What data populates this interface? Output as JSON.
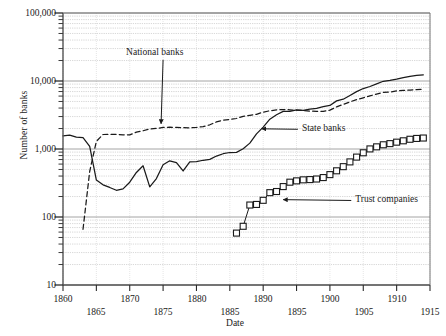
{
  "chart_data": {
    "type": "line",
    "title": "",
    "xlabel": "Date",
    "ylabel": "Number of banks",
    "xlim": [
      1860,
      1915
    ],
    "ylim": [
      10,
      100000
    ],
    "yscale": "log",
    "grid": true,
    "legend_position": "inline-annotations",
    "xticks": [
      1860,
      1865,
      1870,
      1875,
      1880,
      1885,
      1890,
      1895,
      1900,
      1905,
      1910,
      1915
    ],
    "xtick_labels": [
      "1860",
      "1865",
      "1870",
      "1875",
      "1880",
      "1885",
      "1890",
      "1895",
      "1900",
      "1905",
      "1910",
      "1915"
    ],
    "yticks": [
      10,
      100,
      1000,
      10000,
      100000
    ],
    "ytick_labels": [
      "10",
      "100",
      "1,000",
      "10,000",
      "100,000"
    ],
    "annotations": [
      {
        "name": "national-banks",
        "text": "National banks",
        "x": 1875.0,
        "y": 26000,
        "arrow_to_x": 1874.7,
        "arrow_to_y": 2350
      },
      {
        "name": "state-banks",
        "text": "State banks",
        "x": 1895.2,
        "y": 1950,
        "arrow_to_x": 1889.8,
        "arrow_to_y": 1980
      },
      {
        "name": "trust-companies",
        "text": "Trust companies",
        "x": 1903.2,
        "y": 175,
        "arrow_to_x": 1893.0,
        "arrow_to_y": 180
      }
    ],
    "series": [
      {
        "name": "National banks",
        "style": "dashed",
        "marker": "none",
        "color": "#1a1a1a",
        "points": [
          [
            1863,
            66
          ],
          [
            1864,
            467
          ],
          [
            1865,
            1294
          ],
          [
            1866,
            1634
          ],
          [
            1867,
            1636
          ],
          [
            1868,
            1640
          ],
          [
            1869,
            1617
          ],
          [
            1870,
            1612
          ],
          [
            1871,
            1767
          ],
          [
            1872,
            1853
          ],
          [
            1873,
            1968
          ],
          [
            1874,
            2004
          ],
          [
            1875,
            2076
          ],
          [
            1876,
            2091
          ],
          [
            1877,
            2078
          ],
          [
            1878,
            2056
          ],
          [
            1879,
            2048
          ],
          [
            1880,
            2076
          ],
          [
            1881,
            2132
          ],
          [
            1882,
            2269
          ],
          [
            1883,
            2501
          ],
          [
            1884,
            2664
          ],
          [
            1885,
            2714
          ],
          [
            1886,
            2809
          ],
          [
            1887,
            3014
          ],
          [
            1888,
            3120
          ],
          [
            1889,
            3239
          ],
          [
            1890,
            3484
          ],
          [
            1891,
            3652
          ],
          [
            1892,
            3759
          ],
          [
            1893,
            3807
          ],
          [
            1894,
            3770
          ],
          [
            1895,
            3715
          ],
          [
            1896,
            3689
          ],
          [
            1897,
            3610
          ],
          [
            1898,
            3581
          ],
          [
            1899,
            3583
          ],
          [
            1900,
            3731
          ],
          [
            1901,
            4163
          ],
          [
            1902,
            4532
          ],
          [
            1903,
            4935
          ],
          [
            1904,
            5327
          ],
          [
            1905,
            5664
          ],
          [
            1906,
            6046
          ],
          [
            1907,
            6412
          ],
          [
            1908,
            6817
          ],
          [
            1909,
            6886
          ],
          [
            1910,
            7138
          ],
          [
            1911,
            7270
          ],
          [
            1912,
            7366
          ],
          [
            1913,
            7467
          ],
          [
            1914,
            7518
          ]
        ]
      },
      {
        "name": "State banks",
        "style": "solid",
        "marker": "none",
        "color": "#1a1a1a",
        "points": [
          [
            1860,
            1562
          ],
          [
            1861,
            1601
          ],
          [
            1862,
            1492
          ],
          [
            1863,
            1466
          ],
          [
            1864,
            1089
          ],
          [
            1865,
            349
          ],
          [
            1866,
            297
          ],
          [
            1867,
            272
          ],
          [
            1868,
            247
          ],
          [
            1869,
            259
          ],
          [
            1870,
            325
          ],
          [
            1871,
            452
          ],
          [
            1872,
            566
          ],
          [
            1873,
            277
          ],
          [
            1874,
            368
          ],
          [
            1875,
            586
          ],
          [
            1876,
            671
          ],
          [
            1877,
            631
          ],
          [
            1878,
            475
          ],
          [
            1879,
            648
          ],
          [
            1880,
            650
          ],
          [
            1881,
            683
          ],
          [
            1882,
            704
          ],
          [
            1883,
            788
          ],
          [
            1884,
            852
          ],
          [
            1885,
            888
          ],
          [
            1886,
            891
          ],
          [
            1887,
            1007
          ],
          [
            1888,
            1220
          ],
          [
            1889,
            1671
          ],
          [
            1890,
            2101
          ],
          [
            1891,
            2743
          ],
          [
            1892,
            3191
          ],
          [
            1893,
            3579
          ],
          [
            1894,
            3586
          ],
          [
            1895,
            3774
          ],
          [
            1896,
            3708
          ],
          [
            1897,
            3857
          ],
          [
            1898,
            3965
          ],
          [
            1899,
            4191
          ],
          [
            1900,
            4369
          ],
          [
            1901,
            5100
          ],
          [
            1902,
            5397
          ],
          [
            1903,
            6131
          ],
          [
            1904,
            6984
          ],
          [
            1905,
            7744
          ],
          [
            1906,
            8301
          ],
          [
            1907,
            9092
          ],
          [
            1908,
            9902
          ],
          [
            1909,
            10198
          ],
          [
            1910,
            10617
          ],
          [
            1911,
            11250
          ],
          [
            1912,
            11694
          ],
          [
            1913,
            12079
          ],
          [
            1914,
            12350
          ]
        ]
      },
      {
        "name": "Trust companies",
        "style": "solid",
        "marker": "square",
        "color": "#1a1a1a",
        "points": [
          [
            1886,
            58
          ],
          [
            1887,
            73
          ],
          [
            1888,
            150
          ],
          [
            1889,
            153
          ],
          [
            1890,
            176
          ],
          [
            1891,
            228
          ],
          [
            1892,
            237
          ],
          [
            1893,
            280
          ],
          [
            1894,
            325
          ],
          [
            1895,
            340
          ],
          [
            1896,
            352
          ],
          [
            1897,
            355
          ],
          [
            1898,
            362
          ],
          [
            1899,
            380
          ],
          [
            1900,
            420
          ],
          [
            1901,
            478
          ],
          [
            1902,
            550
          ],
          [
            1903,
            646
          ],
          [
            1904,
            760
          ],
          [
            1905,
            880
          ],
          [
            1906,
            1003
          ],
          [
            1907,
            1076
          ],
          [
            1908,
            1154
          ],
          [
            1909,
            1200
          ],
          [
            1910,
            1260
          ],
          [
            1911,
            1320
          ],
          [
            1912,
            1390
          ],
          [
            1913,
            1430
          ],
          [
            1914,
            1450
          ]
        ]
      }
    ]
  },
  "axis": {
    "y_title": "Number of banks",
    "x_title": "Date"
  }
}
